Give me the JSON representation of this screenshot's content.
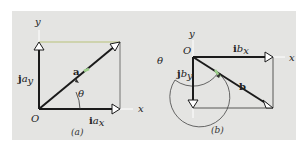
{
  "figure": {
    "panel_a": {
      "caption": "(a)",
      "origin_label": "O",
      "x_axis_label": "x",
      "y_axis_label": "y",
      "vector_label": "a",
      "x_component_label_bold": "i",
      "x_component_label_italic": "a",
      "x_component_subscript": "x",
      "y_component_label_bold": "j",
      "y_component_label_italic": "a",
      "y_component_subscript": "y",
      "angle_label": "θ"
    },
    "panel_b": {
      "caption": "(b)",
      "origin_label": "O",
      "x_axis_label": "x",
      "y_axis_label": "y",
      "vector_label": "b",
      "x_component_label_bold": "i",
      "x_component_label_italic": "b",
      "x_component_subscript": "x",
      "y_component_label_bold": "j",
      "y_component_label_italic": "b",
      "y_component_subscript": "y",
      "angle_label": "θ"
    },
    "colors": {
      "background": "#e4e4e2",
      "lines": "#1a1a1a",
      "highlight": "#9ccf8a",
      "top_edge": "#b8c27a"
    }
  }
}
